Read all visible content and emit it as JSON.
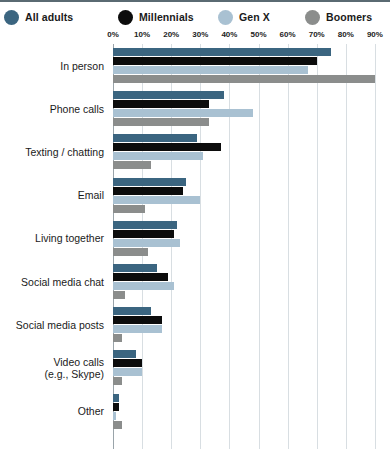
{
  "legend": {
    "items": [
      {
        "label": "All adults",
        "color": "#3b6580",
        "name": "legend-all-adults"
      },
      {
        "label": "Millennials",
        "color": "#0c0c0c",
        "name": "legend-millennials"
      },
      {
        "label": "Gen X",
        "color": "#a9c1d2",
        "name": "legend-gen-x"
      },
      {
        "label": "Boomers",
        "color": "#8b8d8c",
        "name": "legend-boomers"
      }
    ]
  },
  "axis": {
    "ticks": [
      "0%",
      "10%",
      "20%",
      "30%",
      "40%",
      "50%",
      "60%",
      "70%",
      "80%",
      "90%"
    ]
  },
  "chart_data": {
    "type": "bar",
    "orientation": "horizontal",
    "title": "",
    "xlabel": "",
    "ylabel": "",
    "xlim": [
      0,
      90
    ],
    "xticks": [
      0,
      10,
      20,
      30,
      40,
      50,
      60,
      70,
      80,
      90
    ],
    "xtick_labels": [
      "0%",
      "10%",
      "20%",
      "30%",
      "40%",
      "50%",
      "60%",
      "70%",
      "80%",
      "90%"
    ],
    "grid": true,
    "legend_position": "top",
    "categories": [
      "In person",
      "Phone calls",
      "Texting / chatting",
      "Email",
      "Living together",
      "Social media chat",
      "Social media posts",
      "Video calls\n(e.g., Skype)",
      "Other"
    ],
    "series": [
      {
        "name": "All adults",
        "color": "#3b6580",
        "values": [
          75,
          38,
          29,
          25,
          22,
          15,
          13,
          8,
          2
        ]
      },
      {
        "name": "Millennials",
        "color": "#0c0c0c",
        "values": [
          70,
          33,
          37,
          24,
          21,
          19,
          17,
          10,
          2
        ]
      },
      {
        "name": "Gen X",
        "color": "#a9c1d2",
        "values": [
          67,
          48,
          31,
          30,
          23,
          21,
          17,
          10,
          1
        ]
      },
      {
        "name": "Boomers",
        "color": "#8b8d8c",
        "values": [
          90,
          33,
          13,
          11,
          12,
          4,
          3,
          3,
          3
        ]
      }
    ]
  },
  "categories_display": [
    {
      "lines": [
        "In person"
      ]
    },
    {
      "lines": [
        "Phone calls"
      ]
    },
    {
      "lines": [
        "Texting / chatting"
      ]
    },
    {
      "lines": [
        "Email"
      ]
    },
    {
      "lines": [
        "Living together"
      ]
    },
    {
      "lines": [
        "Social media chat"
      ]
    },
    {
      "lines": [
        "Social media posts"
      ]
    },
    {
      "lines": [
        "Video calls",
        "(e.g., Skype)"
      ]
    },
    {
      "lines": [
        "Other"
      ]
    }
  ]
}
